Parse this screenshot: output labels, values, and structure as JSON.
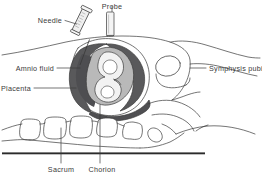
{
  "diagram": {
    "type": "medical-illustration",
    "background_color": "#ffffff",
    "line_color": "#3a3a3a",
    "labels": {
      "needle": "Needle",
      "probe": "Probe",
      "amnio_fluid": "Amnio fluid",
      "placenta": "Placenta",
      "symphysis_pubis": "Symphysis pubis",
      "sacrum": "Sacrum",
      "chorion": "Chorion"
    },
    "colors": {
      "placenta_dark": "#59595b",
      "chorion_dark": "#4f4f52",
      "amnio_light": "#b9b9b9",
      "fetus_fill": "#f2f2f2",
      "outline": "#3a3a3a",
      "baseline": "#2b2b2b",
      "needle_fill": "#efefef",
      "probe_fill": "#f4f4f4"
    },
    "structures": [
      {
        "name": "needle-syringe",
        "label": "Needle"
      },
      {
        "name": "ultrasound-probe",
        "label": "Probe"
      },
      {
        "name": "amniotic-fluid",
        "label": "Amnio fluid"
      },
      {
        "name": "placenta",
        "label": "Placenta"
      },
      {
        "name": "symphysis-pubis",
        "label": "Symphysis pubis"
      },
      {
        "name": "sacrum",
        "label": "Sacrum"
      },
      {
        "name": "chorion",
        "label": "Chorion"
      }
    ]
  }
}
